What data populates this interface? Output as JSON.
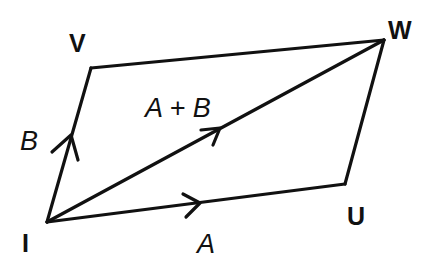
{
  "diagram": {
    "type": "parallelogram-vector-addition",
    "stroke_color": "#111111",
    "background": "#ffffff",
    "vertices": {
      "I": {
        "label": "I",
        "x": 47,
        "y": 222
      },
      "V": {
        "label": "V",
        "x": 91,
        "y": 68
      },
      "W": {
        "label": "W",
        "x": 384,
        "y": 40
      },
      "U": {
        "label": "U",
        "x": 345,
        "y": 184
      }
    },
    "vectors": {
      "A": {
        "label": "A",
        "from": "I",
        "to": "U"
      },
      "B": {
        "label": "B",
        "from": "I",
        "to": "V"
      },
      "sum": {
        "label": "A + B",
        "from": "I",
        "to": "W"
      }
    },
    "edges": [
      {
        "from": "I",
        "to": "U"
      },
      {
        "from": "U",
        "to": "W"
      },
      {
        "from": "W",
        "to": "V"
      },
      {
        "from": "V",
        "to": "I"
      },
      {
        "from": "I",
        "to": "W"
      }
    ]
  }
}
